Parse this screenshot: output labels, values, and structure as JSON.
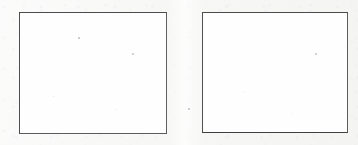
{
  "page": {
    "kind": "scanned-document-fragment",
    "width": 358,
    "height": 145,
    "background_color": "#f7f7f6"
  },
  "style": {
    "frame_border_color": "#5a5a5c",
    "frame_border_color_dark_edge": "#4b4b4d",
    "frame_fill_color": "#fefefe",
    "frame_border_width_px": 1.5,
    "speck_color": "#8c8a8c"
  },
  "frames": [
    {
      "id": "frame-left",
      "label": "",
      "content": "",
      "x": 19,
      "y": 12,
      "width": 148,
      "height": 122,
      "empty": true,
      "specks": [
        {
          "x": 58,
          "y": 24
        },
        {
          "x": 33,
          "y": 83
        },
        {
          "x": 112,
          "y": 40
        },
        {
          "x": 96,
          "y": 96
        }
      ]
    },
    {
      "id": "frame-right",
      "label": "",
      "content": "",
      "x": 202,
      "y": 12,
      "width": 146,
      "height": 121,
      "empty": true,
      "specks": [
        {
          "x": 113,
          "y": 40
        },
        {
          "x": 40,
          "y": 78
        },
        {
          "x": 88,
          "y": 100
        }
      ]
    }
  ],
  "artifacts": {
    "gutter_speck": {
      "x": 188,
      "y": 108
    }
  }
}
